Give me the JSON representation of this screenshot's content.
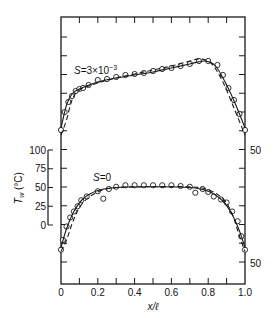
{
  "chart_data": {
    "type": "line",
    "title": "",
    "xlabel": "x/ℓ",
    "ylabel": "T_w (°C)",
    "xlim": [
      0,
      1.0
    ],
    "x_ticks": [
      "0",
      "0.2",
      "0.4",
      "0.6",
      "0.8",
      "1.0"
    ],
    "left_axis": {
      "ticks": [
        "100",
        "75",
        "50",
        "25",
        "0"
      ],
      "label_main": "T",
      "label_sub": "w",
      "label_unit": "(°C)"
    },
    "right_axis": {
      "ticks": [
        "50",
        "50"
      ]
    },
    "grid": false,
    "legend": "none",
    "panels": [
      {
        "name": "S=3×10⁻³",
        "label_prefix": "S",
        "label_text": "=3×10",
        "label_exp": "−3",
        "series": [
          {
            "name": "measured",
            "style": "circles",
            "x": [
              0.0,
              0.02,
              0.04,
              0.06,
              0.08,
              0.1,
              0.12,
              0.15,
              0.2,
              0.25,
              0.3,
              0.35,
              0.4,
              0.45,
              0.5,
              0.55,
              0.6,
              0.65,
              0.7,
              0.75,
              0.8,
              0.85,
              0.88,
              0.91,
              0.94,
              0.97,
              1.0
            ],
            "y_px": [
              130,
              112,
              102,
              96,
              91,
              89,
              88,
              85,
              80,
              79,
              77,
              75,
              74,
              73,
              71,
              69,
              68,
              66,
              64,
              61,
              61,
              65,
              75,
              88,
              100,
              114,
              130
            ]
          },
          {
            "name": "solid model",
            "style": "solid",
            "x": [
              0.0,
              0.03,
              0.06,
              0.1,
              0.2,
              0.3,
              0.4,
              0.5,
              0.6,
              0.7,
              0.78,
              0.84,
              0.9,
              0.95,
              1.0
            ],
            "y_px": [
              128,
              105,
              94,
              89,
              82,
              78,
              75,
              72,
              68,
              64,
              61,
              66,
              85,
              105,
              128
            ]
          },
          {
            "name": "dashed model",
            "style": "dashed",
            "x": [
              0.0,
              0.03,
              0.06,
              0.1,
              0.2,
              0.3,
              0.4,
              0.5,
              0.6,
              0.7,
              0.76,
              0.82,
              0.88,
              0.94,
              1.0
            ],
            "y_px": [
              135,
              120,
              100,
              90,
              83,
              78,
              74,
              70,
              66,
              61,
              59,
              64,
              82,
              108,
              135
            ]
          }
        ]
      },
      {
        "name": "S=0",
        "label_prefix": "S",
        "label_text": "=0",
        "label_exp": "",
        "series": [
          {
            "name": "measured",
            "style": "circles",
            "x": [
              0.0,
              0.01,
              0.03,
              0.05,
              0.07,
              0.09,
              0.11,
              0.14,
              0.2,
              0.23,
              0.26,
              0.3,
              0.35,
              0.4,
              0.45,
              0.5,
              0.55,
              0.6,
              0.65,
              0.7,
              0.73,
              0.77,
              0.8,
              0.83,
              0.87,
              0.9,
              0.93,
              0.96,
              0.98,
              1.0
            ],
            "values_c": [
              -33,
              -20,
              -2,
              10,
              18,
              25,
              33,
              38,
              45,
              35,
              48,
              51,
              53,
              53,
              53,
              53,
              53,
              53,
              52,
              51,
              43,
              48,
              44,
              38,
              34,
              30,
              18,
              5,
              -15,
              -33
            ]
          },
          {
            "name": "solid model",
            "style": "solid",
            "x": [
              0.0,
              0.03,
              0.07,
              0.12,
              0.2,
              0.3,
              0.5,
              0.7,
              0.8,
              0.88,
              0.93,
              0.97,
              1.0
            ],
            "values_c": [
              -30,
              -5,
              18,
              35,
              46,
              50,
              51,
              50,
              45,
              32,
              14,
              -8,
              -30
            ]
          },
          {
            "name": "dashed model",
            "style": "dashed",
            "x": [
              0.0,
              0.03,
              0.07,
              0.12,
              0.2,
              0.3,
              0.5,
              0.7,
              0.8,
              0.88,
              0.93,
              0.97,
              1.0
            ],
            "values_c": [
              -35,
              -20,
              8,
              30,
              44,
              50,
              51,
              51,
              47,
              35,
              15,
              -15,
              -35
            ]
          }
        ]
      }
    ]
  }
}
